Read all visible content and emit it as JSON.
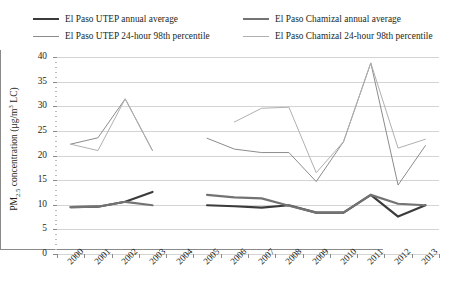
{
  "legend": {
    "items": [
      {
        "label": "El Paso UTEP annual average",
        "color": "#3b3b3b",
        "width": 2.2,
        "row": 1,
        "col": 1
      },
      {
        "label": "El Paso Chamizal annual average",
        "color": "#737373",
        "width": 2.2,
        "row": 1,
        "col": 2
      },
      {
        "label": "El Paso UTEP 24-hour 98th percentile",
        "color": "#8c8c8c",
        "width": 1.0,
        "row": 2,
        "col": 1
      },
      {
        "label": "El Paso Chamizal 24-hour 98th percentile",
        "color": "#b0b0b0",
        "width": 1.0,
        "row": 2,
        "col": 2
      }
    ]
  },
  "axes": {
    "ylabel_pre": "PM",
    "ylabel_sub": "2.5",
    "ylabel_mid": " concentration (μg/m",
    "ylabel_sup": "3",
    "ylabel_post": " LC)",
    "ylabel_plain": "PM2.5 concentration (μg/m3 LC)",
    "yticks": [
      0,
      5,
      10,
      15,
      20,
      25,
      30,
      35,
      40
    ],
    "ylim": [
      0,
      40
    ],
    "xticks": [
      "2000",
      "2001",
      "2002",
      "2003",
      "2004",
      "2005",
      "2006",
      "2007",
      "2008",
      "2009",
      "2010",
      "2011",
      "2012",
      "2013"
    ],
    "grid": true
  },
  "chart_data": {
    "type": "line",
    "title": "",
    "xlabel": "",
    "ylabel": "PM2.5 concentration (μg/m3 LC)",
    "ylim": [
      0,
      40
    ],
    "yticks": [
      0,
      5,
      10,
      15,
      20,
      25,
      30,
      35,
      40
    ],
    "x": [
      "2000",
      "2001",
      "2002",
      "2003",
      "2004",
      "2005",
      "2006",
      "2007",
      "2008",
      "2009",
      "2010",
      "2011",
      "2012",
      "2013"
    ],
    "legend_position": "above-plot",
    "grid": "horizontal",
    "series": [
      {
        "name": "El Paso UTEP annual average",
        "color": "#3b3b3b",
        "x": [
          "2000",
          "2001",
          "2002",
          "2003",
          "2005",
          "2006",
          "2007",
          "2008",
          "2009",
          "2010",
          "2011",
          "2012",
          "2013"
        ],
        "values": [
          9.5,
          9.6,
          10.6,
          12.6,
          9.9,
          9.7,
          9.4,
          9.9,
          8.4,
          8.4,
          12.0,
          7.6,
          9.9
        ]
      },
      {
        "name": "El Paso Chamizal annual average",
        "color": "#737373",
        "x": [
          "2000",
          "2001",
          "2002",
          "2003",
          "2005",
          "2006",
          "2007",
          "2008",
          "2009",
          "2010",
          "2011",
          "2012",
          "2013"
        ],
        "values": [
          9.5,
          9.6,
          10.6,
          9.9,
          12.0,
          11.5,
          11.3,
          9.8,
          8.4,
          8.4,
          12.0,
          10.2,
          9.9
        ]
      },
      {
        "name": "El Paso UTEP 24-hour 98th percentile",
        "color": "#8c8c8c",
        "x": [
          "2000",
          "2001",
          "2002",
          "2003",
          "2005",
          "2006",
          "2007",
          "2008",
          "2009",
          "2010",
          "2011",
          "2012",
          "2013"
        ],
        "values": [
          22.3,
          23.6,
          31.5,
          21.0,
          23.5,
          21.3,
          20.6,
          20.6,
          14.7,
          22.8,
          38.8,
          14.0,
          22.0
        ]
      },
      {
        "name": "El Paso Chamizal 24-hour 98th percentile",
        "color": "#b0b0b0",
        "x": [
          "2000",
          "2001",
          "2002",
          "2003",
          "2006",
          "2007",
          "2008",
          "2009",
          "2010",
          "2011",
          "2012",
          "2013"
        ],
        "values": [
          22.3,
          21.0,
          31.5,
          21.0,
          26.8,
          29.6,
          29.8,
          16.5,
          22.8,
          38.8,
          21.5,
          23.3
        ]
      }
    ]
  }
}
